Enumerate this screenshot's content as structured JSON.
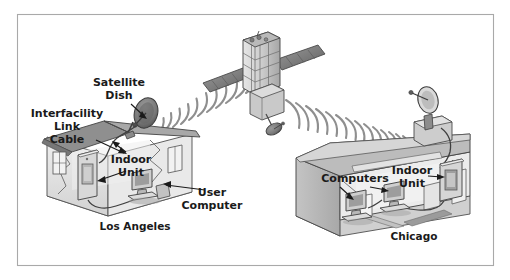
{
  "figure": {
    "frame": {
      "border_color": "#a9a9a9",
      "background": "#ffffff",
      "x": 17,
      "y": 14,
      "width": 477,
      "height": 252
    }
  },
  "labels": {
    "satellite_dish": {
      "lines": [
        "Satellite",
        "Dish"
      ],
      "x": 119,
      "y": 86
    },
    "interfacility_link_cable": {
      "lines": [
        "Interfacility",
        "Link",
        "Cable"
      ],
      "x": 67,
      "y": 117
    },
    "indoor_unit_left": {
      "lines": [
        "Indoor",
        "Unit"
      ],
      "x": 131,
      "y": 163
    },
    "user_computer": {
      "lines": [
        "User",
        "Computer"
      ],
      "x": 212,
      "y": 196
    },
    "computers": {
      "lines": [
        "Computers"
      ],
      "x": 355,
      "y": 182
    },
    "indoor_unit_right": {
      "lines": [
        "Indoor",
        "Unit"
      ],
      "x": 412,
      "y": 174
    },
    "city_left": {
      "text": "Los Angeles",
      "x": 135,
      "y": 230
    },
    "city_right": {
      "text": "Chicago",
      "x": 414,
      "y": 240
    }
  },
  "icons": {
    "satellite": "satellite-icon",
    "dish_left": "satellite-dish-icon",
    "dish_right": "satellite-dish-icon",
    "house_left": "house-icon",
    "building_right": "office-building-icon",
    "indoor_unit_left": "indoor-unit-icon",
    "indoor_unit_right": "indoor-unit-icon",
    "computer_user": "desktop-computer-icon",
    "computer_a": "desktop-computer-icon",
    "computer_b": "desktop-computer-icon",
    "waves_uplink": "radio-waves-icon",
    "waves_downlink": "radio-waves-icon"
  },
  "colors": {
    "ink": "#1a1a1a",
    "outline": "#3f3f3f",
    "frame": "#a9a9a9",
    "wave": "#8d8d8d",
    "dish_dark": "#6f6f6f",
    "dish_mid": "#8a8a8a",
    "wall_light": "#e8e8e8",
    "wall_mid": "#cfcfcf",
    "wall_dark": "#b3b3b3",
    "roof": "#9a9a9a",
    "screen": "#d5d5d5",
    "shadow": "#7d7d7d"
  },
  "link": {
    "uplink_wave_count": 11,
    "downlink_wave_count": 14,
    "uplink_direction": "Los Angeles to satellite",
    "downlink_direction": "satellite to Chicago"
  }
}
